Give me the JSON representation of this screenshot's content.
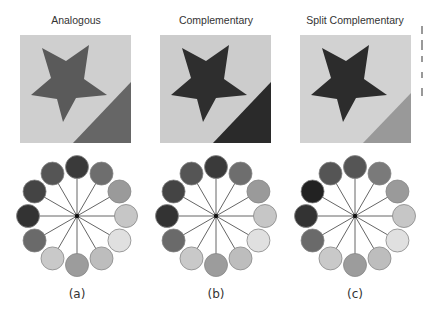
{
  "panels": [
    {
      "title": "Analogous",
      "caption": "(a)",
      "swatch": {
        "background": "#cfcfcf",
        "star": "#5a5a5a",
        "corner": "#666666"
      },
      "wheel": [
        "#3a3a3a",
        "#6e6e6e",
        "#9a9a9a",
        "#c6c6c6",
        "#e0e0e0",
        "#bdbdbd",
        "#9c9c9c",
        "#c9c9c9",
        "#6a6a6a",
        "#333333",
        "#444444",
        "#555555"
      ]
    },
    {
      "title": "Complementary",
      "caption": "(b)",
      "swatch": {
        "background": "#cccccc",
        "star": "#2e2e2e",
        "corner": "#2a2a2a"
      },
      "wheel": [
        "#3a3a3a",
        "#6e6e6e",
        "#9a9a9a",
        "#c6c6c6",
        "#e0e0e0",
        "#bdbdbd",
        "#9c9c9c",
        "#c9c9c9",
        "#6a6a6a",
        "#333333",
        "#444444",
        "#555555"
      ]
    },
    {
      "title": "Split Complementary",
      "caption": "(c)",
      "swatch": {
        "background": "#d2d2d2",
        "star": "#2c2c2c",
        "corner": "#999999"
      },
      "wheel": [
        "#555555",
        "#7a7a7a",
        "#9a9a9a",
        "#c6c6c6",
        "#e0e0e0",
        "#bdbdbd",
        "#9c9c9c",
        "#c9c9c9",
        "#6a6a6a",
        "#333333",
        "#222222",
        "#555555"
      ]
    }
  ]
}
